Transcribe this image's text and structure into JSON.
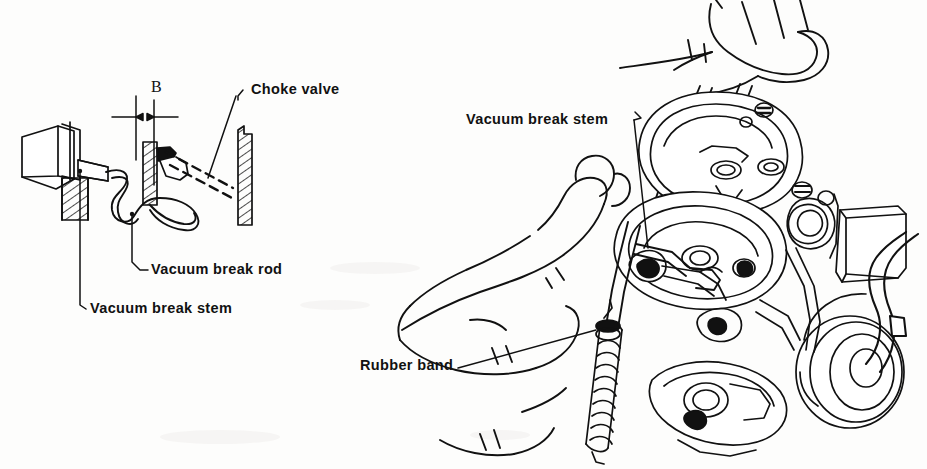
{
  "figure": {
    "type": "technical-line-illustration",
    "background_color": "#fdfdfc",
    "ink_color": "#111111",
    "panels": [
      {
        "name": "schematic-detail",
        "position": "left",
        "description": "Cross-section schematic of vacuum break stem, vacuum break rod and choke valve showing clearance dimension B"
      },
      {
        "name": "photo-style-carburetor",
        "position": "right",
        "description": "Line drawing of hands holding a carburetor with a rubber band (coil spring) attached, showing the vacuum break stem being pushed"
      }
    ]
  },
  "labels": {
    "dimension_b": "B",
    "choke_valve": "Choke valve",
    "vacuum_break_rod": "Vacuum break rod",
    "vacuum_break_stem_left": "Vacuum break stem",
    "vacuum_break_stem_right": "Vacuum break stem",
    "rubber_band": "Rubber band"
  },
  "callouts": [
    {
      "text": "B",
      "kind": "dimension",
      "panel": "schematic-detail"
    },
    {
      "text": "Choke valve",
      "kind": "leader-label",
      "panel": "schematic-detail"
    },
    {
      "text": "Vacuum break rod",
      "kind": "leader-label",
      "panel": "schematic-detail"
    },
    {
      "text": "Vacuum break stem",
      "kind": "leader-label",
      "panel": "schematic-detail"
    },
    {
      "text": "Vacuum break stem",
      "kind": "leader-label",
      "panel": "photo-style-carburetor"
    },
    {
      "text": "Rubber band",
      "kind": "leader-label",
      "panel": "photo-style-carburetor"
    }
  ]
}
